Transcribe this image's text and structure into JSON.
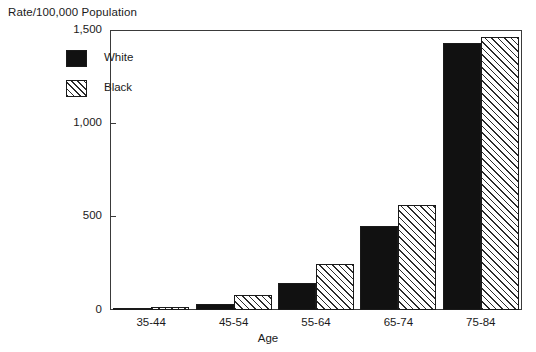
{
  "chart_data": {
    "type": "bar",
    "title": "",
    "ylabel": "Rate/100,000 Population",
    "xlabel": "Age",
    "categories": [
      "35-44",
      "45-54",
      "55-64",
      "65-74",
      "75-84"
    ],
    "series": [
      {
        "name": "White",
        "values": [
          8,
          32,
          145,
          450,
          1430
        ],
        "style": "solid-black"
      },
      {
        "name": "Black",
        "values": [
          18,
          78,
          245,
          565,
          1465
        ],
        "style": "diagonal-hatch"
      }
    ],
    "ylim": [
      0,
      1500
    ],
    "yticks": [
      0,
      500,
      1000,
      1500
    ],
    "ytick_labels": [
      "0",
      "500",
      "1,000",
      "1,500"
    ],
    "grid": false,
    "legend_position": "upper-left-inside",
    "frame": true
  },
  "axis": {
    "caption": "Rate/100,000 Population",
    "x_title": "Age"
  },
  "legend": {
    "entries": [
      {
        "label": "White",
        "swatch": "solid-black-swatch"
      },
      {
        "label": "Black",
        "swatch": "hatched-swatch"
      }
    ]
  },
  "colors": {
    "white_series": "#111111",
    "black_series_hatch": "#2b2b2b",
    "axis": "#3a3a3a",
    "background": "#ffffff",
    "text": "#1a1a1a"
  }
}
